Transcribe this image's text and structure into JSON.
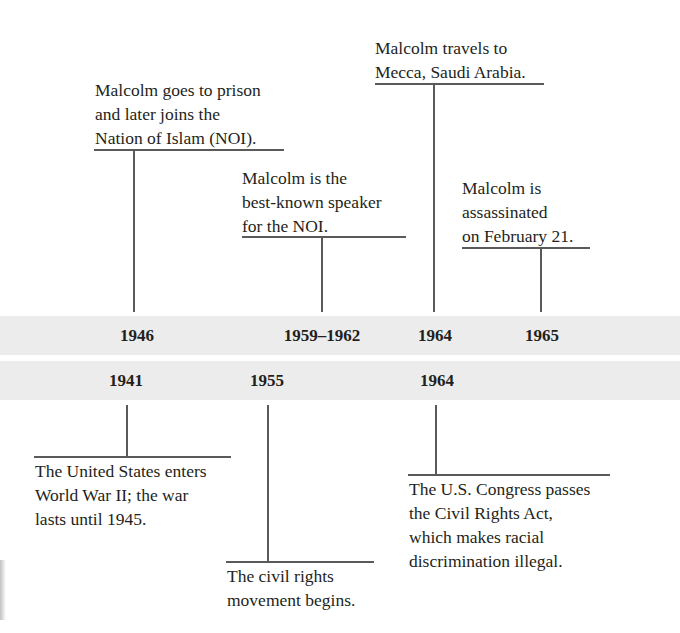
{
  "timeline": {
    "top_events": [
      {
        "year": "1946",
        "text": "Malcolm goes to prison\nand later joins the\nNation of Islam (NOI)."
      },
      {
        "year": "1959–1962",
        "text": "Malcolm is the\nbest-known speaker\nfor the NOI."
      },
      {
        "year": "1964",
        "text": "Malcolm travels to\nMecca, Saudi Arabia."
      },
      {
        "year": "1965",
        "text": "Malcolm is\nassassinated\non February 21."
      }
    ],
    "bottom_events": [
      {
        "year": "1941",
        "text": "The United States enters\nWorld War II; the war\nlasts until 1945."
      },
      {
        "year": "1955",
        "text": "The civil rights\nmovement begins."
      },
      {
        "year": "1964",
        "text": "The U.S. Congress passes\nthe Civil Rights Act,\nwhich makes racial\ndiscrimination illegal."
      }
    ]
  },
  "colors": {
    "band": "#ececec",
    "line": "#5a5a5a",
    "text": "#231f20"
  }
}
